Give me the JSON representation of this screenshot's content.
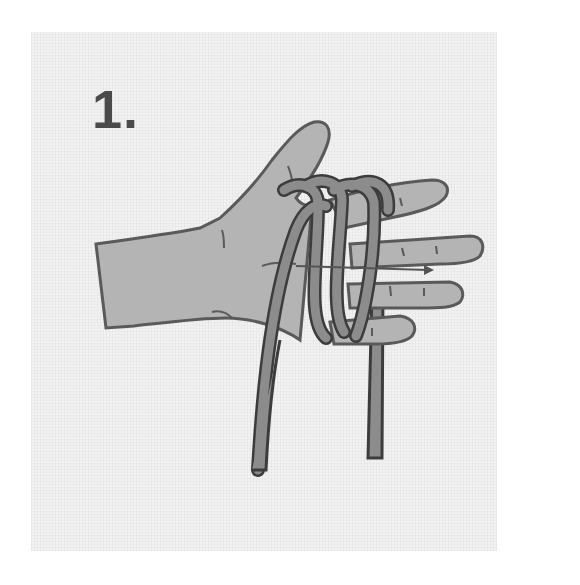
{
  "figure": {
    "step_label": "1.",
    "colors": {
      "background": "#ffffff",
      "panel": "#f2f2f2",
      "skin": "#b4b4b4",
      "skin_outline": "#5a5a5a",
      "rope": "#8c8c8c",
      "rope_outline": "#3c3c3c",
      "label": "#4a4a4a"
    }
  }
}
